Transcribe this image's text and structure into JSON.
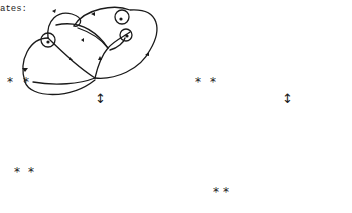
{
  "caption_fragment": "ates:",
  "symbols": {
    "star": "*",
    "equivalence_arrow": "↕"
  },
  "diagrams": [
    {
      "id": "top-left",
      "description": "state diagram with circled nodes (before move)"
    },
    {
      "id": "top-right",
      "description": "state diagram with circled nodes (before move)"
    },
    {
      "id": "bottom-left",
      "description": "equivalent state diagram (after move)"
    },
    {
      "id": "bottom-right",
      "description": "equivalent state diagram (after move)"
    }
  ],
  "colors": {
    "stroke": "#1a1a1a",
    "background": "#ffffff"
  }
}
